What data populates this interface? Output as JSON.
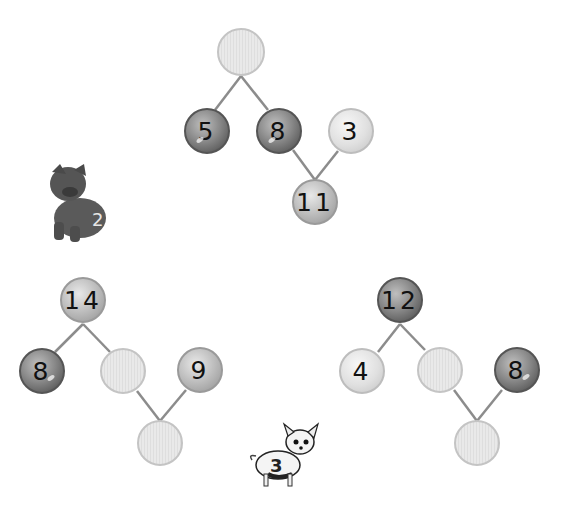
{
  "worksheet": {
    "puzzles": [
      {
        "name": "top",
        "circles": [
          {
            "id": "top-sum",
            "value": "",
            "style": "empty",
            "x": 241,
            "y": 52
          },
          {
            "id": "addend-a",
            "value": "5",
            "style": "dark",
            "x": 207,
            "y": 131
          },
          {
            "id": "addend-b",
            "value": "8",
            "style": "dark",
            "x": 279,
            "y": 131
          },
          {
            "id": "addend-c",
            "value": "3",
            "style": "light",
            "x": 351,
            "y": 131
          },
          {
            "id": "bottom-sum",
            "value": "11",
            "style": "mid",
            "x": 315,
            "y": 202
          }
        ]
      },
      {
        "name": "left",
        "circles": [
          {
            "id": "top-sum",
            "value": "14",
            "style": "mid",
            "x": 83,
            "y": 300
          },
          {
            "id": "addend-a",
            "value": "8",
            "style": "dark",
            "x": 42,
            "y": 371
          },
          {
            "id": "addend-b",
            "value": "",
            "style": "empty",
            "x": 123,
            "y": 371
          },
          {
            "id": "addend-c",
            "value": "9",
            "style": "mid",
            "x": 200,
            "y": 370
          },
          {
            "id": "bottom-sum",
            "value": "",
            "style": "empty",
            "x": 160,
            "y": 443
          }
        ]
      },
      {
        "name": "right",
        "circles": [
          {
            "id": "top-sum",
            "value": "12",
            "style": "dark",
            "x": 400,
            "y": 300
          },
          {
            "id": "addend-a",
            "value": "4",
            "style": "light",
            "x": 362,
            "y": 371
          },
          {
            "id": "addend-b",
            "value": "",
            "style": "empty",
            "x": 440,
            "y": 370
          },
          {
            "id": "addend-c",
            "value": "8",
            "style": "dark",
            "x": 517,
            "y": 370
          },
          {
            "id": "bottom-sum",
            "value": "",
            "style": "empty",
            "x": 477,
            "y": 443
          }
        ]
      }
    ],
    "mascots": [
      {
        "name": "dog-number-2",
        "label": "2"
      },
      {
        "name": "dog-number-3",
        "label": "3"
      }
    ]
  }
}
